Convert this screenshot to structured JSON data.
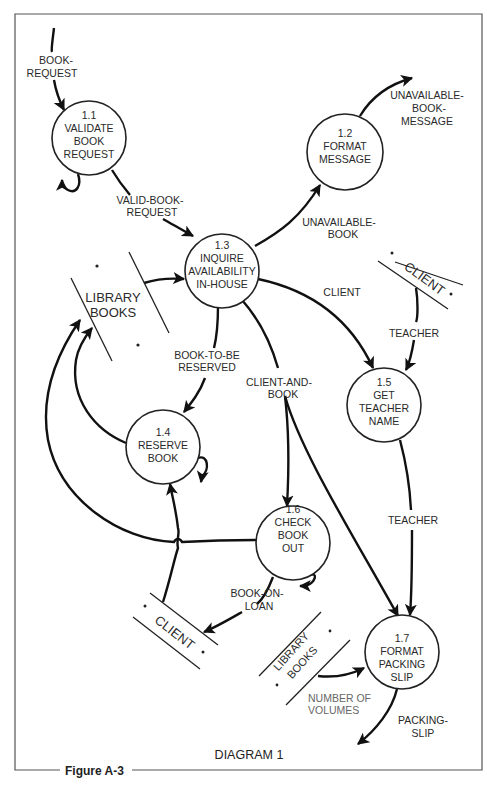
{
  "diagram": {
    "title": "DIAGRAM 1",
    "figure_label": "Figure A-3",
    "processes": [
      {
        "id": "1.1",
        "lines": [
          "1.1",
          "VALIDATE",
          "BOOK",
          "REQUEST"
        ]
      },
      {
        "id": "1.2",
        "lines": [
          "1.2",
          "FORMAT",
          "MESSAGE"
        ]
      },
      {
        "id": "1.3",
        "lines": [
          "1.3",
          "INQUIRE",
          "AVAILABILITY",
          "IN-HOUSE"
        ]
      },
      {
        "id": "1.4",
        "lines": [
          "1.4",
          "RESERVE",
          "BOOK"
        ]
      },
      {
        "id": "1.5",
        "lines": [
          "1.5",
          "GET",
          "TEACHER",
          "NAME"
        ]
      },
      {
        "id": "1.6",
        "lines": [
          "1.6",
          "CHECK",
          "BOOK",
          "OUT"
        ]
      },
      {
        "id": "1.7",
        "lines": [
          "1.7",
          "FORMAT",
          "PACKING",
          "SLIP"
        ]
      }
    ],
    "data_stores": [
      {
        "id": "library-books-main",
        "lines": [
          "LIBRARY",
          "BOOKS"
        ],
        "marker": "*"
      },
      {
        "id": "client-top",
        "lines": [
          "CLIENT"
        ],
        "marker": "*"
      },
      {
        "id": "client-bottom",
        "lines": [
          "CLIENT"
        ],
        "marker": "*"
      },
      {
        "id": "library-books-small",
        "lines": [
          "LIBRARY",
          "BOOKS"
        ],
        "marker": "*"
      }
    ],
    "flows": [
      {
        "id": "book-request",
        "lines": [
          "BOOK-",
          "REQUEST"
        ]
      },
      {
        "id": "valid-book-request",
        "lines": [
          "VALID-BOOK-",
          "REQUEST"
        ]
      },
      {
        "id": "unavailable-book",
        "lines": [
          "UNAVAILABLE-",
          "BOOK"
        ]
      },
      {
        "id": "unavailable-book-message",
        "lines": [
          "UNAVAILABLE-",
          "BOOK-",
          "MESSAGE"
        ]
      },
      {
        "id": "client",
        "lines": [
          "CLIENT"
        ]
      },
      {
        "id": "teacher-in",
        "lines": [
          "TEACHER"
        ]
      },
      {
        "id": "book-to-be-reserved",
        "lines": [
          "BOOK-TO-BE",
          "RESERVED"
        ]
      },
      {
        "id": "client-and-book",
        "lines": [
          "CLIENT-AND-",
          "BOOK"
        ]
      },
      {
        "id": "teacher-out",
        "lines": [
          "TEACHER"
        ]
      },
      {
        "id": "book-on-loan",
        "lines": [
          "BOOK-ON-",
          "LOAN"
        ]
      },
      {
        "id": "number-of-volumes",
        "lines": [
          "NUMBER OF",
          "VOLUMES"
        ]
      },
      {
        "id": "packing-slip",
        "lines": [
          "PACKING-",
          "SLIP"
        ]
      }
    ]
  }
}
